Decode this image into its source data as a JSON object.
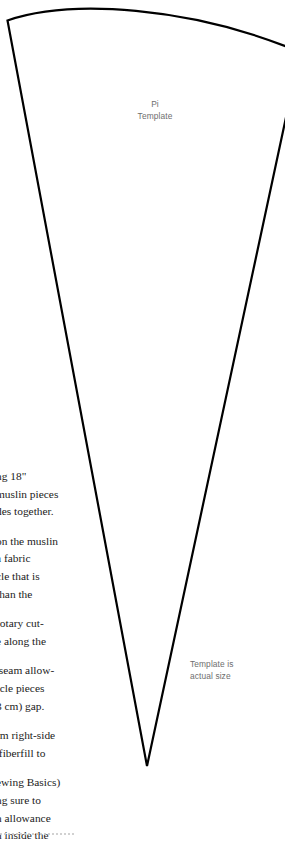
{
  "page": {
    "background_color": "#ffffff",
    "ink_color": "#000000",
    "text_color": "#1b1b1b",
    "label_color": "#6e6e6e"
  },
  "template": {
    "shape_name": "pie-wedge-template",
    "title_line_1": "Pi",
    "title_line_2": "Template",
    "size_note_line_1": "Template is",
    "size_note_line_2": "actual size",
    "outline_color": "#000000",
    "outline_width": "2.2"
  },
  "instructions": {
    "paragraphs": [
      {
        "id": "paragraph-1",
        "lines": [
          "ng 18\"",
          "muslin pieces",
          "des together."
        ]
      },
      {
        "id": "paragraph-2",
        "lines": [
          "on the muslin",
          "a fabric",
          "cle that is",
          "than the"
        ]
      },
      {
        "id": "paragraph-3",
        "lines": [
          "rotary cut-",
          "e along the"
        ]
      },
      {
        "id": "paragraph-4",
        "lines": [
          " seam allow-",
          "rcle pieces",
          "3 cm) gap."
        ]
      },
      {
        "id": "paragraph-5",
        "lines": [
          "rm right-side",
          " fiberfill to"
        ]
      },
      {
        "id": "paragraph-6",
        "lines": [
          "ewing Basics)",
          "ng sure to",
          "n allowance",
          "n inside the"
        ]
      }
    ]
  },
  "footer": {
    "rule_name": "dotted-trim-rule"
  }
}
